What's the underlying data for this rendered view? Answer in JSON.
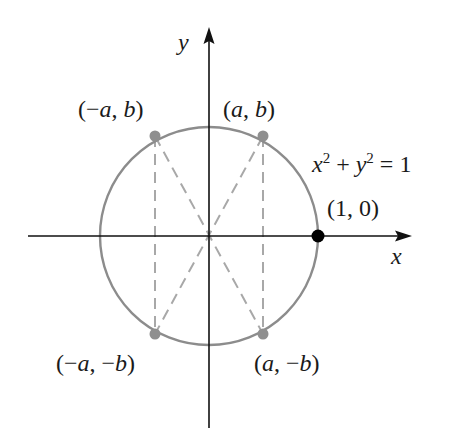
{
  "diagram": {
    "type": "unit-circle-symmetry",
    "equation": {
      "x": "x",
      "sup_x": "2",
      "plus": " + ",
      "y": "y",
      "sup_y": "2",
      "eq": " = 1"
    },
    "axes": {
      "x_label": "x",
      "y_label": "y"
    },
    "points": {
      "p1": {
        "label": "(1, 0)"
      },
      "q1": {
        "label": "(a, b)"
      },
      "q2": {
        "label": "(−a, b)"
      },
      "q3": {
        "label": "(−a, −b)"
      },
      "q4": {
        "label": "(a, −b)"
      }
    },
    "colors": {
      "axis": "#111111",
      "circle": "#8c8c8c",
      "dashed": "#a8a8a8",
      "gray_point": "#8f8f8f",
      "black_point": "#000000"
    }
  }
}
